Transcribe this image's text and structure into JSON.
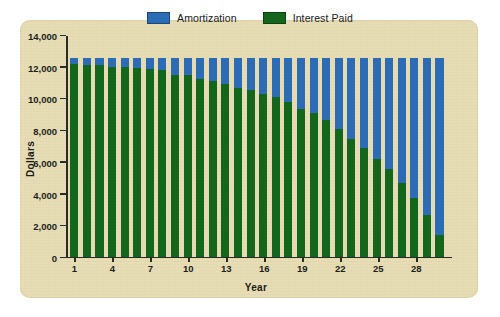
{
  "card": {
    "background_color": "#e6dcb4"
  },
  "legend": {
    "position": "top-center",
    "items": [
      {
        "label": "Amortization",
        "color": "#2c6cb5",
        "icon": "legend-swatch"
      },
      {
        "label": "Interest Paid",
        "color": "#14661d",
        "icon": "legend-swatch"
      }
    ]
  },
  "axes": {
    "y_title": "Dollars",
    "x_title": "Year",
    "y_ticks": [
      "0",
      "2,000",
      "4,000",
      "6,000",
      "8,000",
      "10,000",
      "12,000",
      "14,000"
    ],
    "x_ticks": [
      "1",
      "4",
      "7",
      "10",
      "13",
      "16",
      "19",
      "22",
      "25",
      "28"
    ]
  },
  "chart_data": {
    "type": "bar",
    "stacked": true,
    "title": "",
    "xlabel": "Year",
    "ylabel": "Dollars",
    "ylim": [
      0,
      14000
    ],
    "ytick_values": [
      0,
      2000,
      4000,
      6000,
      8000,
      10000,
      12000,
      14000
    ],
    "grid": false,
    "legend_position": "top-center",
    "categories": [
      1,
      2,
      3,
      4,
      5,
      6,
      7,
      8,
      9,
      10,
      11,
      12,
      13,
      14,
      15,
      16,
      17,
      18,
      19,
      20,
      21,
      22,
      23,
      24,
      25,
      26,
      27,
      28,
      29,
      30
    ],
    "xtick_labels": [
      1,
      4,
      7,
      10,
      13,
      16,
      19,
      22,
      25,
      28
    ],
    "series": [
      {
        "name": "Interest Paid",
        "color": "#14661d",
        "values": [
          12150,
          12100,
          12050,
          11980,
          11950,
          11900,
          11850,
          11780,
          11450,
          11420,
          11180,
          11050,
          10900,
          10620,
          10480,
          10250,
          10080,
          9750,
          9300,
          9080,
          8620,
          8050,
          7400,
          6850,
          6150,
          5500,
          4620,
          3720,
          2620,
          1340
        ]
      },
      {
        "name": "Amortization",
        "color": "#2c6cb5",
        "values": [
          400,
          450,
          500,
          570,
          600,
          650,
          700,
          770,
          1100,
          1130,
          1370,
          1500,
          1650,
          1930,
          2070,
          2300,
          2470,
          2800,
          3250,
          3470,
          3930,
          4500,
          5150,
          5700,
          6400,
          7050,
          7930,
          8830,
          9930,
          11210
        ]
      }
    ],
    "stack_total_approx": 12550
  }
}
